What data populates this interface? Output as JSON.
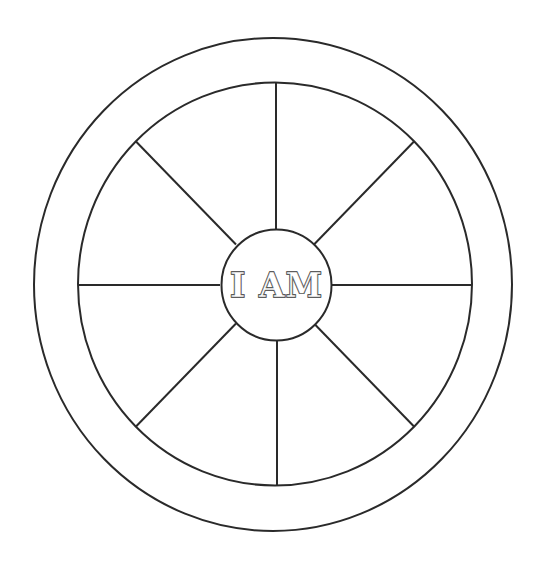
{
  "diagram": {
    "center_label": "I AM",
    "segments": 8,
    "segment_labels": [
      "",
      "",
      "",
      "",
      "",
      "",
      "",
      ""
    ],
    "rim_labels": [],
    "colors": {
      "line": "#2a2a2a",
      "background": "#ffffff"
    }
  }
}
